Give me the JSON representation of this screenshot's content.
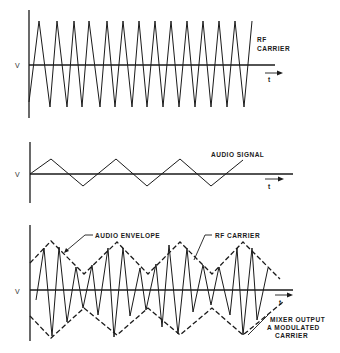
{
  "panels": [
    {
      "id": "rf-carrier",
      "y_label": "V",
      "x_label": "t",
      "labels": [
        "RF",
        "CARRIER"
      ],
      "axis": {
        "x0": 29,
        "y_top": 10,
        "y_bottom": 118,
        "baseline": 65,
        "x_end": 275
      },
      "wave_points": "29,102 39,21 50,107 57,21 67,107 74,21 82,107 89,21 100,107 107,21 115,107 123,21 132,107 139,21 147,107 155,21 163,107 171,21 179,107 187,21 195,107 203,21 211,107 219,21 227,107 235,21 244,107 252,21"
    },
    {
      "id": "audio-signal",
      "y_label": "V",
      "x_label": "t",
      "labels": [
        "AUDIO SIGNAL"
      ],
      "axis": {
        "x0": 30,
        "y_top": 142,
        "y_bottom": 203,
        "baseline": 174,
        "x_end": 293
      },
      "wave_points": "30,174 51,159 83,186 116,159 147,186 180,159 211,186 243,160"
    },
    {
      "id": "mixer-output",
      "y_label": "V",
      "x_label": "t",
      "labels": [
        "AUDIO ENVELOPE",
        "RF CARRIER",
        "MIXER OUTPUT",
        "A MODULATED",
        "CARRIER"
      ],
      "axis": {
        "x0": 30,
        "y_top": 225,
        "y_bottom": 341,
        "baseline": 290,
        "x_end": 293
      },
      "upper_envelope": "30,263 51,241 84,274 117,242 148,274 180,242 212,274 243,242 280,279",
      "lower_envelope": "30,316 51,338 84,308 117,335 148,308 180,335 212,308 243,335 283,302",
      "carrier_points": "36,300 44,248 52,336 59,247 67,322 76,267 83,308 92,265 98,315 108,248 114,337 123,248 130,316 140,268 146,310 156,264 162,327 169,245 178,334 187,248 193,312 203,265 211,305 219,267 230,315 237,248 243,335 252,248 257,320 268,268"
    }
  ],
  "text": {
    "p1_v": "V",
    "p1_t": "t",
    "p1_rf": "RF",
    "p1_carrier": "CARRIER",
    "p2_v": "V",
    "p2_t": "t",
    "p2_audio_signal": "AUDIO  SIGNAL",
    "p3_v": "V",
    "p3_t": "t",
    "p3_audio_envelope": "AUDIO  ENVELOPE",
    "p3_rf_carrier": "RF  CARRIER",
    "p3_mixer_line1": "MIXER  OUTPUT",
    "p3_mixer_line2": "A MODULATED",
    "p3_mixer_line3": "CARRIER"
  },
  "colors": {
    "ink": "#1a1a1a",
    "background": "#ffffff"
  }
}
